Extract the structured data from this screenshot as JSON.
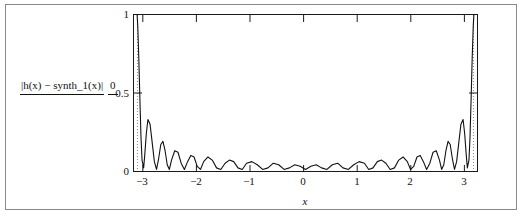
{
  "figure": {
    "background": "#ffffff",
    "frame_color": "#8a8a8a",
    "axis_color": "#1a1a1a",
    "curve_color": "#111111"
  },
  "yaxis": {
    "expression_numerator": "|h(x) − synth_1(x)|",
    "expression_denominator": "0",
    "ticks": [
      "1",
      "0.5",
      "0"
    ]
  },
  "xaxis": {
    "title": "x",
    "ticks": [
      "−3",
      "−2",
      "−1",
      "0",
      "1",
      "2",
      "3"
    ]
  },
  "chart_data": {
    "type": "line",
    "title": "",
    "subtitle": "",
    "xlabel": "x",
    "ylabel": "|h(x) - synth_1(x)|",
    "xlim": [
      -3.2,
      3.2
    ],
    "ylim": [
      0,
      1
    ],
    "xticks": [
      -3,
      -2,
      -1,
      0,
      1,
      2,
      3
    ],
    "yticks": [
      0,
      0.5,
      1
    ],
    "grid": false,
    "legend": null,
    "series": [
      {
        "name": "|h(x) - synth_1(x)|",
        "x": [
          -3.14159,
          -3.13,
          -3.11,
          -3.09,
          -3.07,
          -3.05,
          -3.02,
          -3.0,
          -2.97,
          -2.94,
          -2.9,
          -2.86,
          -2.82,
          -2.78,
          -2.74,
          -2.7,
          -2.66,
          -2.62,
          -2.58,
          -2.54,
          -2.5,
          -2.44,
          -2.38,
          -2.32,
          -2.26,
          -2.2,
          -2.14,
          -2.08,
          -2.02,
          -1.96,
          -1.9,
          -1.82,
          -1.74,
          -1.66,
          -1.58,
          -1.5,
          -1.42,
          -1.34,
          -1.26,
          -1.18,
          -1.1,
          -1.0,
          -0.9,
          -0.8,
          -0.7,
          -0.6,
          -0.5,
          -0.4,
          -0.3,
          -0.2,
          -0.1,
          0.0,
          0.1,
          0.2,
          0.3,
          0.4,
          0.5,
          0.6,
          0.7,
          0.8,
          0.9,
          1.0,
          1.1,
          1.18,
          1.26,
          1.34,
          1.42,
          1.5,
          1.58,
          1.66,
          1.74,
          1.82,
          1.9,
          1.96,
          2.02,
          2.08,
          2.14,
          2.2,
          2.26,
          2.32,
          2.38,
          2.44,
          2.5,
          2.54,
          2.58,
          2.62,
          2.66,
          2.7,
          2.74,
          2.78,
          2.82,
          2.86,
          2.9,
          2.94,
          2.97,
          3.0,
          3.02,
          3.05,
          3.07,
          3.09,
          3.11,
          3.13,
          3.14159
        ],
        "y": [
          1.0,
          0.93,
          0.72,
          0.46,
          0.22,
          0.07,
          0.02,
          0.1,
          0.24,
          0.33,
          0.3,
          0.18,
          0.06,
          0.01,
          0.08,
          0.17,
          0.19,
          0.13,
          0.04,
          0.01,
          0.07,
          0.13,
          0.12,
          0.05,
          0.01,
          0.06,
          0.1,
          0.09,
          0.03,
          0.01,
          0.06,
          0.09,
          0.07,
          0.02,
          0.01,
          0.05,
          0.07,
          0.06,
          0.02,
          0.01,
          0.05,
          0.06,
          0.04,
          0.01,
          0.02,
          0.05,
          0.04,
          0.01,
          0.02,
          0.04,
          0.03,
          0.01,
          0.03,
          0.04,
          0.02,
          0.01,
          0.04,
          0.05,
          0.02,
          0.01,
          0.04,
          0.06,
          0.05,
          0.01,
          0.02,
          0.06,
          0.07,
          0.05,
          0.01,
          0.02,
          0.07,
          0.09,
          0.06,
          0.01,
          0.03,
          0.09,
          0.1,
          0.06,
          0.01,
          0.05,
          0.12,
          0.13,
          0.07,
          0.01,
          0.04,
          0.13,
          0.19,
          0.17,
          0.08,
          0.01,
          0.06,
          0.18,
          0.3,
          0.33,
          0.24,
          0.1,
          0.02,
          0.07,
          0.22,
          0.46,
          0.72,
          0.93,
          1.0
        ]
      }
    ]
  }
}
